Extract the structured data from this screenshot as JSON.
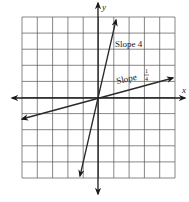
{
  "figure": {
    "axes": {
      "x_label": "x",
      "y_label": "y"
    },
    "grid": {
      "columns": 10,
      "rows": 10
    },
    "lines": [
      {
        "name": "steep-line",
        "label": "Slope 4",
        "slope": 4
      },
      {
        "name": "shallow-line",
        "label_prefix": "Slope",
        "label_num": "1",
        "label_den": "4",
        "slope": 0.25
      }
    ],
    "colors": {
      "grid": "#555555",
      "axis": "#1a1a1a",
      "line": "#2a2a2a"
    }
  }
}
